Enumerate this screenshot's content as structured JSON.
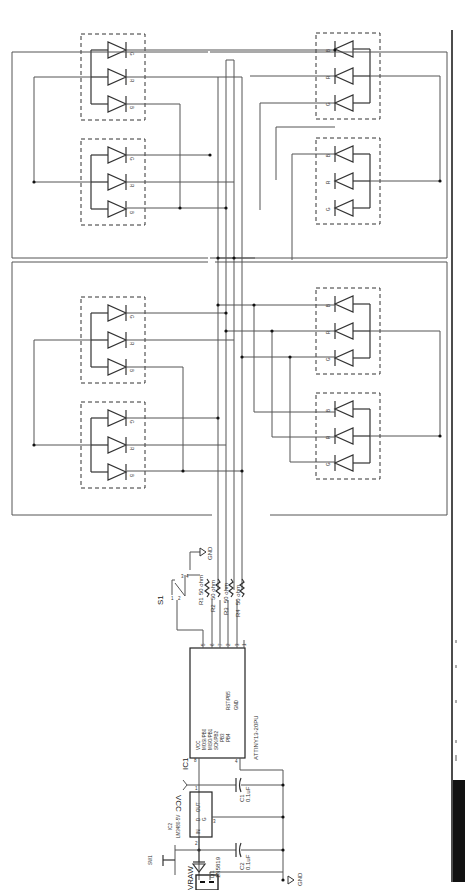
{
  "figure": {
    "orientation": "rotated-90-ccw",
    "caption_visible_text": ""
  },
  "led_labels": {
    "g": "G",
    "r": "R",
    "b": "B"
  },
  "components": {
    "vraw": {
      "ref": "VRAW",
      "pin1": "1",
      "pin2": "2"
    },
    "d1": {
      "ref": "D1",
      "value": "1N5819"
    },
    "sw1": {
      "ref": "SW1"
    },
    "c2": {
      "ref": "C2",
      "value": "0.1uF"
    },
    "ic2": {
      "ref": "IC2",
      "value": "LM3480-5V",
      "pin_in": "IN",
      "pin_out": "OUT",
      "pin_g": "G",
      "pin_d": "D",
      "pin1": "1",
      "pin2": "2",
      "pin3": "3"
    },
    "c1": {
      "ref": "C1",
      "value": "0.1uF"
    },
    "vcc": {
      "label": "VCC"
    },
    "gnd_bottom": {
      "label": "GND"
    },
    "gnd_top": {
      "label": "GND"
    },
    "ic1": {
      "ref": "IC1",
      "value": "ATTINY13-20PU",
      "pins_left": [
        "VCC",
        "MOSI/PB0",
        "MISO/PB1",
        "SCK/PB2",
        "PB3",
        "PB4",
        "RST/PB5",
        "GND"
      ],
      "pin_numbers": {
        "vcc": "8",
        "gnd": "4",
        "pb0": "5",
        "pb1": "6",
        "pb2": "7",
        "pb3": "2",
        "pb4": "3",
        "pb5": "1"
      }
    },
    "s1": {
      "ref": "S1",
      "pins": [
        "1",
        "2",
        "3",
        "4"
      ]
    },
    "resistors": [
      {
        "ref": "R1",
        "value": "50 ohm"
      },
      {
        "ref": "R2",
        "value": "50 ohm"
      },
      {
        "ref": "R3",
        "value": "50 ohm"
      },
      {
        "ref": "R4",
        "value": "50 ohm"
      }
    ]
  }
}
